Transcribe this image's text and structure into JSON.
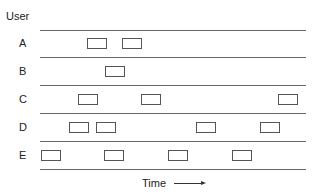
{
  "diagram": {
    "y_axis_label": "User",
    "x_axis_label": "Time",
    "rows": [
      {
        "label": "A",
        "top": 33,
        "boxes": [
          87,
          122
        ]
      },
      {
        "label": "B",
        "top": 61,
        "boxes": [
          105
        ]
      },
      {
        "label": "C",
        "top": 89,
        "boxes": [
          78,
          141,
          278
        ]
      },
      {
        "label": "D",
        "top": 117,
        "boxes": [
          69,
          96,
          196,
          260
        ]
      },
      {
        "label": "E",
        "top": 145,
        "boxes": [
          41,
          104,
          168,
          232
        ]
      }
    ],
    "line_positions": [
      30,
      57,
      85,
      113,
      141,
      169
    ]
  }
}
